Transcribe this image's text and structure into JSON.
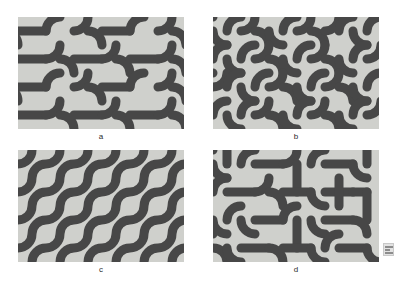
{
  "figure": {
    "panel_count": 4,
    "background_color": "#ffffff",
    "tile_background_color": "#cfd0cc",
    "stroke_color": "#474747",
    "panel_width_px": 166,
    "panel_height_px": 112,
    "stroke_width_px": 9,
    "tile_size_px": 28,
    "panels": [
      {
        "id": "a",
        "label": "a",
        "pattern_name": "hook-bracket-truchet",
        "description": "Thick rounded curves forming opposing hook and bracket motifs; arcs pair into D-shaped and U-shaped forms.",
        "grid_cols": 6,
        "grid_rows": 4
      },
      {
        "id": "b",
        "label": "b",
        "pattern_name": "s-serpentine-truchet",
        "description": "Arcs joined into continuous S-shaped serpentine bands running diagonally.",
        "grid_cols": 6,
        "grid_rows": 4
      },
      {
        "id": "c",
        "label": "c",
        "pattern_name": "diagonal-wave-truchet",
        "description": "Uniform arc orientation producing unbroken parallel wavy diagonal lines.",
        "grid_cols": 6,
        "grid_rows": 4
      },
      {
        "id": "d",
        "label": "d",
        "pattern_name": "mixed-arc-straight-truchet",
        "description": "Random mix of quarter arcs and straight crossing segments producing an irregular maze.",
        "grid_cols": 6,
        "grid_rows": 4
      }
    ]
  },
  "watermark": {
    "icon_name": "watermark-badge-icon",
    "visible": true
  }
}
